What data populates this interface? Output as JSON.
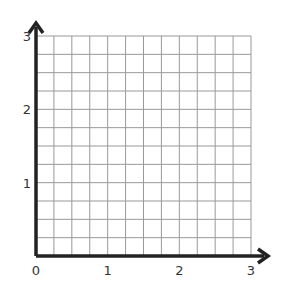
{
  "chart_data": {
    "type": "grid",
    "title": "",
    "xlabel": "",
    "ylabel": "",
    "xlim": [
      0,
      3
    ],
    "ylim": [
      0,
      3
    ],
    "x_ticks": [
      "0",
      "1",
      "2",
      "3"
    ],
    "y_ticks": [
      "1",
      "2",
      "3"
    ],
    "grid": true,
    "grid_subdivisions_per_unit": 4,
    "series": [],
    "axis_arrows": true
  },
  "colors": {
    "axis": "#222222",
    "grid": "#999999",
    "text": "#333333"
  }
}
